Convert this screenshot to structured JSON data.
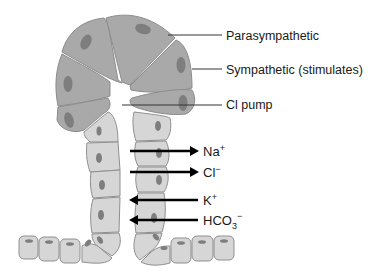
{
  "diagram": {
    "labels": {
      "parasympathetic": "Parasympathetic",
      "sympathetic": "Sympathetic (stimulates)",
      "cl_pump": "Cl pump"
    },
    "ions": [
      {
        "name": "Na",
        "charge": "+",
        "direction": "out"
      },
      {
        "name": "Cl",
        "charge": "−",
        "direction": "out"
      },
      {
        "name": "K",
        "charge": "+",
        "direction": "in"
      },
      {
        "name": "HCO",
        "subscript": "3",
        "charge": "−",
        "direction": "in"
      }
    ],
    "colors": {
      "acinar_cell": "#a9a9a9",
      "duct_cell": "#d6d6d6",
      "nucleus": "#7e7e7e",
      "outline": "#8c8c8c",
      "arrow": "#000000"
    }
  }
}
